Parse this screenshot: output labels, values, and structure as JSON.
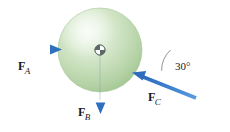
{
  "figure": {
    "type": "free-body-diagram",
    "background_color": "#ffffff",
    "body": {
      "shape": "sphere",
      "fill_light": "#e4f0de",
      "fill_mid": "#c3ddb8",
      "fill_dark": "#a9cc9c",
      "outline_color": "#9dc391",
      "center_marker": "center-of-mass"
    },
    "axis_line_color": "#8a9a96"
  },
  "forces": [
    {
      "id": "fa",
      "symbol": "F",
      "subscript": "A",
      "label": "F_A",
      "direction": "right",
      "angle_deg": 0,
      "color": "#3c80d0"
    },
    {
      "id": "fb",
      "symbol": "F",
      "subscript": "B",
      "label": "F_B",
      "direction": "down",
      "angle_deg": 270,
      "color": "#3c80d0"
    },
    {
      "id": "fc",
      "symbol": "F",
      "subscript": "C",
      "label": "F_C",
      "direction": "up-left",
      "angle_deg": 150,
      "color": "#3c80d0"
    }
  ],
  "annotations": {
    "angle": {
      "value": "30",
      "unit": "°",
      "text": "30°",
      "measured_between": "horizontal-axis and F_C"
    }
  }
}
